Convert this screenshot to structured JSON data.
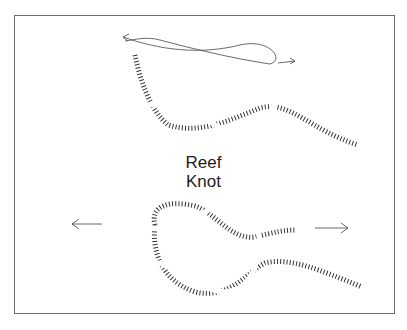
{
  "diagram": {
    "title_line1": "Reef",
    "title_line2": "Knot",
    "panels": [
      {
        "name": "top",
        "description": "Two rope ends crossed, with loop arrow showing tuck direction"
      },
      {
        "name": "bottom",
        "description": "Completed reef knot with pull arrows left and right"
      }
    ],
    "arrows": {
      "top": [
        "left",
        "right"
      ],
      "bottom": [
        "left",
        "right"
      ]
    },
    "colors": {
      "line": "#333333",
      "frame": "#6e6e6e",
      "background": "#ffffff"
    }
  }
}
